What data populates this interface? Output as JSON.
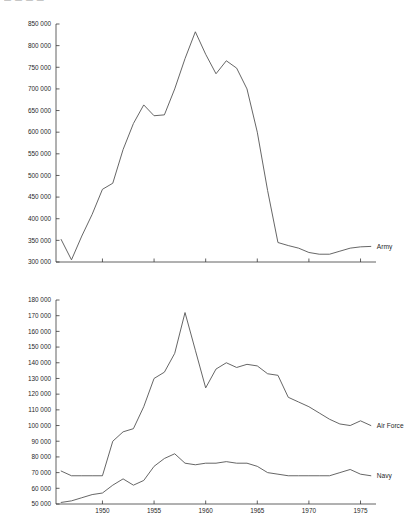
{
  "header": {
    "clipped_text": "— — — —"
  },
  "chart_data": [
    {
      "type": "line",
      "title": "",
      "xlabel": "",
      "ylabel": "",
      "ylim": [
        300000,
        850000
      ],
      "xlim": [
        1945.5,
        1976.5
      ],
      "ytick_labels": [
        "850 000",
        "800 000",
        "750 000",
        "700 000",
        "650 000",
        "600 000",
        "550 000",
        "500 000",
        "450 000",
        "400 000",
        "350 000",
        "300 000"
      ],
      "ytick_values": [
        850000,
        800000,
        750000,
        700000,
        650000,
        600000,
        550000,
        500000,
        450000,
        400000,
        350000,
        300000
      ],
      "xtick_labels": [],
      "xtick_values": [
        1950,
        1955,
        1960,
        1965,
        1970,
        1975
      ],
      "grid": false,
      "legend_position": "right-inline",
      "series": [
        {
          "name": "Army",
          "label": "Army",
          "x": [
            1946,
            1947,
            1948,
            1949,
            1950,
            1951,
            1952,
            1953,
            1954,
            1955,
            1956,
            1957,
            1958,
            1959,
            1960,
            1961,
            1962,
            1963,
            1964,
            1965,
            1966,
            1967,
            1968,
            1969,
            1970,
            1971,
            1972,
            1973,
            1974,
            1975,
            1976
          ],
          "values": [
            352000,
            305000,
            360000,
            410000,
            468000,
            482000,
            560000,
            620000,
            663000,
            638000,
            640000,
            700000,
            770000,
            832000,
            780000,
            735000,
            765000,
            748000,
            700000,
            600000,
            465000,
            345000,
            338000,
            332000,
            322000,
            318000,
            318000,
            325000,
            332000,
            335000,
            336000
          ]
        }
      ]
    },
    {
      "type": "line",
      "title": "",
      "xlabel": "",
      "ylabel": "",
      "ylim": [
        50000,
        180000
      ],
      "xlim": [
        1945.5,
        1976.5
      ],
      "ytick_labels": [
        "180 000",
        "170 000",
        "160 000",
        "150 000",
        "140 000",
        "130 000",
        "120 000",
        "110 000",
        "100 000",
        "90 000",
        "80 000",
        "70 000",
        "60 000",
        "50 000"
      ],
      "ytick_values": [
        180000,
        170000,
        160000,
        150000,
        140000,
        130000,
        120000,
        110000,
        100000,
        90000,
        80000,
        70000,
        60000,
        50000
      ],
      "xtick_labels": [
        "1950",
        "1955",
        "1960",
        "1965",
        "1970",
        "1975"
      ],
      "xtick_values": [
        1950,
        1955,
        1960,
        1965,
        1970,
        1975
      ],
      "grid": false,
      "legend_position": "right-inline",
      "series": [
        {
          "name": "Air Force",
          "label": "Air Force",
          "x": [
            1946,
            1947,
            1948,
            1949,
            1950,
            1951,
            1952,
            1953,
            1954,
            1955,
            1956,
            1957,
            1958,
            1959,
            1960,
            1961,
            1962,
            1963,
            1964,
            1965,
            1966,
            1967,
            1968,
            1969,
            1970,
            1971,
            1972,
            1973,
            1974,
            1975,
            1976
          ],
          "values": [
            71000,
            68000,
            68000,
            68000,
            68000,
            90000,
            96000,
            98000,
            112000,
            130000,
            134000,
            146000,
            172000,
            148000,
            124000,
            136000,
            140000,
            137000,
            139000,
            138000,
            133000,
            132000,
            118000,
            115000,
            112000,
            108000,
            104000,
            101000,
            100000,
            103000,
            100000
          ]
        },
        {
          "name": "Navy",
          "label": "Navy",
          "x": [
            1946,
            1947,
            1948,
            1949,
            1950,
            1951,
            1952,
            1953,
            1954,
            1955,
            1956,
            1957,
            1958,
            1959,
            1960,
            1961,
            1962,
            1963,
            1964,
            1965,
            1966,
            1967,
            1968,
            1969,
            1970,
            1971,
            1972,
            1973,
            1974,
            1975,
            1976
          ],
          "values": [
            51000,
            52000,
            54000,
            56000,
            57000,
            62000,
            66000,
            62000,
            65000,
            74000,
            79000,
            82000,
            76000,
            75000,
            76000,
            76000,
            77000,
            76000,
            76000,
            74000,
            70000,
            69000,
            68000,
            68000,
            68000,
            68000,
            68000,
            70000,
            72000,
            69000,
            68000
          ]
        }
      ]
    }
  ]
}
